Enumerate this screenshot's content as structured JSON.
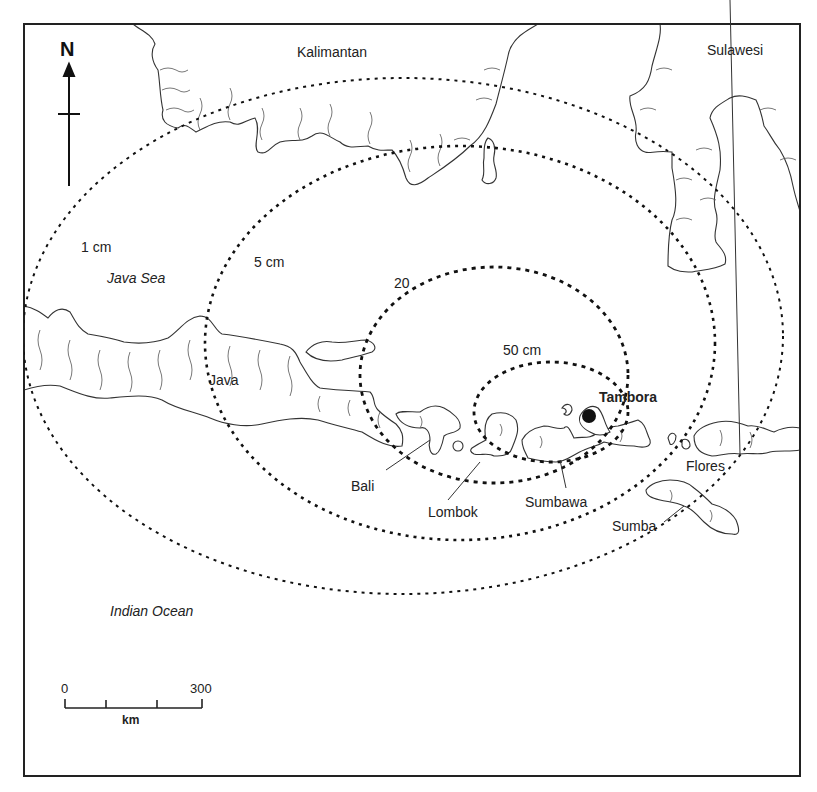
{
  "map": {
    "frame": {
      "x": 24,
      "y": 24,
      "width": 776,
      "height": 752,
      "stroke": "#222222"
    },
    "north_arrow": {
      "label": "N",
      "icon": "north-arrow-icon"
    },
    "regions": [
      {
        "name": "Kalimantan",
        "style": "normal"
      },
      {
        "name": "Sulawesi",
        "style": "normal"
      },
      {
        "name": "Java Sea",
        "style": "italic"
      },
      {
        "name": "Java",
        "style": "normal"
      },
      {
        "name": "Bali",
        "style": "normal"
      },
      {
        "name": "Lombok",
        "style": "normal"
      },
      {
        "name": "Sumbawa",
        "style": "normal"
      },
      {
        "name": "Tambora",
        "style": "bold"
      },
      {
        "name": "Flores",
        "style": "normal"
      },
      {
        "name": "Sumba",
        "style": "normal"
      },
      {
        "name": "Indian Ocean",
        "style": "italic"
      }
    ],
    "isopachs": [
      {
        "label": "1 cm",
        "cx": 403,
        "cy": 336,
        "rx": 380,
        "ry": 258
      },
      {
        "label": "5 cm",
        "cx": 460,
        "cy": 343,
        "rx": 255,
        "ry": 197
      },
      {
        "label": "20",
        "cx": 494,
        "cy": 375,
        "rx": 134,
        "ry": 108
      },
      {
        "label": "50 cm",
        "cx": 551,
        "cy": 412,
        "rx": 77,
        "ry": 50
      }
    ],
    "volcano": {
      "name": "Tambora",
      "x": 589,
      "y": 416,
      "color": "#111111"
    },
    "scale_bar": {
      "start": "0",
      "end": "300",
      "unit": "km"
    }
  }
}
